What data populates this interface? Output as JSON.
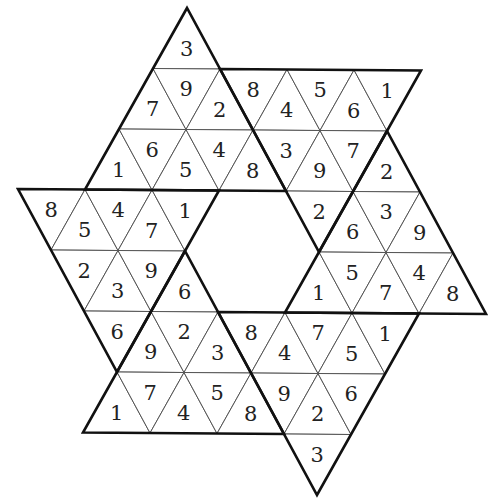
{
  "puzzle": {
    "type": "star-sudoku",
    "title": "",
    "lattice": {
      "origin": [
        187,
        8
      ],
      "e_col": [
        67,
        0.5
      ],
      "e_row": [
        -34,
        60.5
      ]
    },
    "cells": [
      {
        "t": "U",
        "r": 0,
        "c": 0,
        "v": "3"
      },
      {
        "t": "U",
        "r": 1,
        "c": 0,
        "v": "7"
      },
      {
        "t": "D",
        "r": 1,
        "c": 0,
        "v": "9"
      },
      {
        "t": "U",
        "r": 1,
        "c": 1,
        "v": "2"
      },
      {
        "t": "D",
        "r": 1,
        "c": 1,
        "v": "8"
      },
      {
        "t": "U",
        "r": 1,
        "c": 2,
        "v": "4"
      },
      {
        "t": "D",
        "r": 1,
        "c": 2,
        "v": "5"
      },
      {
        "t": "U",
        "r": 1,
        "c": 3,
        "v": "6"
      },
      {
        "t": "D",
        "r": 1,
        "c": 3,
        "v": "1"
      },
      {
        "t": "U",
        "r": 2,
        "c": 0,
        "v": "1"
      },
      {
        "t": "D",
        "r": 2,
        "c": 0,
        "v": "6"
      },
      {
        "t": "U",
        "r": 2,
        "c": 1,
        "v": "5"
      },
      {
        "t": "D",
        "r": 2,
        "c": 1,
        "v": "4"
      },
      {
        "t": "U",
        "r": 2,
        "c": 2,
        "v": "8"
      },
      {
        "t": "D",
        "r": 2,
        "c": 2,
        "v": "3"
      },
      {
        "t": "U",
        "r": 2,
        "c": 3,
        "v": "9"
      },
      {
        "t": "D",
        "r": 2,
        "c": 3,
        "v": "7"
      },
      {
        "t": "U",
        "r": 2,
        "c": 4,
        "v": "2"
      },
      {
        "t": "D",
        "r": 3,
        "c": -1,
        "v": "8"
      },
      {
        "t": "U",
        "r": 3,
        "c": 0,
        "v": "5"
      },
      {
        "t": "D",
        "r": 3,
        "c": 0,
        "v": "4"
      },
      {
        "t": "U",
        "r": 3,
        "c": 1,
        "v": "7"
      },
      {
        "t": "D",
        "r": 3,
        "c": 1,
        "v": "1"
      },
      {
        "t": "D",
        "r": 3,
        "c": 3,
        "v": "2"
      },
      {
        "t": "U",
        "r": 3,
        "c": 4,
        "v": "6"
      },
      {
        "t": "D",
        "r": 3,
        "c": 4,
        "v": "3"
      },
      {
        "t": "U",
        "r": 3,
        "c": 5,
        "v": "9"
      },
      {
        "t": "D",
        "r": 4,
        "c": 0,
        "v": "2"
      },
      {
        "t": "U",
        "r": 4,
        "c": 1,
        "v": "3"
      },
      {
        "t": "D",
        "r": 4,
        "c": 1,
        "v": "9"
      },
      {
        "t": "U",
        "r": 4,
        "c": 2,
        "v": "6"
      },
      {
        "t": "U",
        "r": 4,
        "c": 4,
        "v": "1"
      },
      {
        "t": "D",
        "r": 4,
        "c": 4,
        "v": "5"
      },
      {
        "t": "U",
        "r": 4,
        "c": 5,
        "v": "7"
      },
      {
        "t": "D",
        "r": 4,
        "c": 5,
        "v": "4"
      },
      {
        "t": "U",
        "r": 4,
        "c": 6,
        "v": "8"
      },
      {
        "t": "D",
        "r": 5,
        "c": 1,
        "v": "6"
      },
      {
        "t": "U",
        "r": 5,
        "c": 2,
        "v": "9"
      },
      {
        "t": "D",
        "r": 5,
        "c": 2,
        "v": "2"
      },
      {
        "t": "U",
        "r": 5,
        "c": 3,
        "v": "3"
      },
      {
        "t": "D",
        "r": 5,
        "c": 3,
        "v": "8"
      },
      {
        "t": "U",
        "r": 5,
        "c": 4,
        "v": "4"
      },
      {
        "t": "D",
        "r": 5,
        "c": 4,
        "v": "7"
      },
      {
        "t": "U",
        "r": 5,
        "c": 5,
        "v": "5"
      },
      {
        "t": "D",
        "r": 5,
        "c": 5,
        "v": "1"
      },
      {
        "t": "U",
        "r": 6,
        "c": 2,
        "v": "1"
      },
      {
        "t": "D",
        "r": 6,
        "c": 2,
        "v": "7"
      },
      {
        "t": "U",
        "r": 6,
        "c": 3,
        "v": "4"
      },
      {
        "t": "D",
        "r": 6,
        "c": 3,
        "v": "5"
      },
      {
        "t": "U",
        "r": 6,
        "c": 4,
        "v": "8"
      },
      {
        "t": "D",
        "r": 6,
        "c": 4,
        "v": "9"
      },
      {
        "t": "U",
        "r": 6,
        "c": 5,
        "v": "2"
      },
      {
        "t": "D",
        "r": 6,
        "c": 5,
        "v": "6"
      },
      {
        "t": "D",
        "r": 7,
        "c": 5,
        "v": "3"
      }
    ],
    "regions": [
      {
        "name": "top",
        "pts": [
          [
            0,
            0
          ],
          [
            3,
            0
          ],
          [
            3,
            3
          ]
        ]
      },
      {
        "name": "top-right",
        "pts": [
          [
            1,
            1
          ],
          [
            1,
            4
          ],
          [
            4,
            4
          ]
        ]
      },
      {
        "name": "right",
        "pts": [
          [
            2,
            4
          ],
          [
            5,
            4
          ],
          [
            5,
            7
          ]
        ]
      },
      {
        "name": "bottom-right",
        "pts": [
          [
            5,
            3
          ],
          [
            5,
            6
          ],
          [
            8,
            6
          ]
        ]
      },
      {
        "name": "bottom-left",
        "pts": [
          [
            4,
            2
          ],
          [
            7,
            2
          ],
          [
            7,
            5
          ]
        ]
      },
      {
        "name": "left",
        "pts": [
          [
            3,
            -1
          ],
          [
            3,
            2
          ],
          [
            6,
            2
          ]
        ]
      }
    ]
  }
}
